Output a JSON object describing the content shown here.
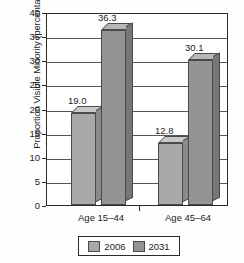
{
  "chart_data": {
    "type": "bar",
    "title": "",
    "xlabel": "",
    "ylabel": "Proportion Visible Minority (percentage)",
    "categories": [
      "Age 15–44",
      "Age 45–64"
    ],
    "series": [
      {
        "name": "2006",
        "values": [
          19.0,
          12.8
        ],
        "color": "#a9a9a9"
      },
      {
        "name": "2031",
        "values": [
          36.3,
          30.1
        ],
        "color": "#949494"
      }
    ],
    "value_labels": [
      "19.0",
      "36.3",
      "12.8",
      "30.1"
    ],
    "ylim": [
      0,
      40
    ],
    "yticks": [
      0,
      5,
      10,
      15,
      20,
      25,
      30,
      35,
      40
    ],
    "ytick_labels": [
      "0",
      "5",
      "10",
      "15",
      "20",
      "25",
      "30",
      "35",
      "40"
    ],
    "grid": "horizontal",
    "legend_position": "bottom",
    "style": "3d-bar"
  },
  "legend": {
    "entries": [
      {
        "label": "2006"
      },
      {
        "label": "2031"
      }
    ]
  }
}
